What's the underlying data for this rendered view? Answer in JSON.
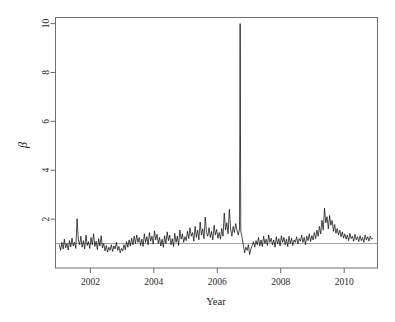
{
  "chart_data": {
    "type": "line",
    "title": "",
    "xlabel": "Year",
    "ylabel": "β",
    "xlim": [
      2000.9,
      2011.05
    ],
    "ylim": [
      0.0,
      10.25
    ],
    "xticks": [
      2002,
      2004,
      2006,
      2008,
      2010
    ],
    "xticklabels": [
      "2002",
      "2004",
      "2006",
      "2008",
      "2010"
    ],
    "yticks": [
      2,
      4,
      6,
      8,
      10
    ],
    "yticklabels": [
      "2",
      "4",
      "6",
      "8",
      "10"
    ],
    "grid": false,
    "legend": false,
    "line_color": "#000000",
    "line_width": 0.7,
    "reference_line": {
      "y": 1.0,
      "color": "#8a8a8a",
      "width": 0.8,
      "orientation": "horizontal"
    },
    "annotations": [
      {
        "text": "extreme spike reaching β ≈ 10 in late 2006",
        "x": 2006.72,
        "y": 10.0
      }
    ],
    "series": [
      {
        "name": "beta",
        "x": [
          2001.02,
          2001.06,
          2001.1,
          2001.14,
          2001.18,
          2001.22,
          2001.26,
          2001.3,
          2001.34,
          2001.38,
          2001.42,
          2001.46,
          2001.5,
          2001.54,
          2001.58,
          2001.62,
          2001.66,
          2001.7,
          2001.74,
          2001.78,
          2001.82,
          2001.86,
          2001.9,
          2001.94,
          2001.98,
          2002.02,
          2002.06,
          2002.1,
          2002.14,
          2002.18,
          2002.22,
          2002.26,
          2002.3,
          2002.34,
          2002.38,
          2002.42,
          2002.46,
          2002.5,
          2002.54,
          2002.58,
          2002.62,
          2002.66,
          2002.7,
          2002.74,
          2002.78,
          2002.82,
          2002.86,
          2002.9,
          2002.94,
          2002.98,
          2003.02,
          2003.06,
          2003.1,
          2003.14,
          2003.18,
          2003.22,
          2003.26,
          2003.3,
          2003.34,
          2003.38,
          2003.42,
          2003.46,
          2003.5,
          2003.54,
          2003.58,
          2003.62,
          2003.66,
          2003.7,
          2003.74,
          2003.78,
          2003.82,
          2003.86,
          2003.9,
          2003.94,
          2003.98,
          2004.02,
          2004.06,
          2004.1,
          2004.14,
          2004.18,
          2004.22,
          2004.26,
          2004.3,
          2004.34,
          2004.38,
          2004.42,
          2004.46,
          2004.5,
          2004.54,
          2004.58,
          2004.62,
          2004.66,
          2004.7,
          2004.74,
          2004.78,
          2004.82,
          2004.86,
          2004.9,
          2004.94,
          2004.98,
          2005.02,
          2005.06,
          2005.1,
          2005.14,
          2005.18,
          2005.22,
          2005.26,
          2005.3,
          2005.34,
          2005.38,
          2005.42,
          2005.46,
          2005.5,
          2005.54,
          2005.58,
          2005.62,
          2005.66,
          2005.7,
          2005.74,
          2005.78,
          2005.82,
          2005.86,
          2005.9,
          2005.94,
          2005.98,
          2006.02,
          2006.06,
          2006.1,
          2006.14,
          2006.18,
          2006.22,
          2006.26,
          2006.3,
          2006.34,
          2006.38,
          2006.42,
          2006.46,
          2006.5,
          2006.54,
          2006.58,
          2006.62,
          2006.66,
          2006.7,
          2006.72,
          2006.74,
          2006.78,
          2006.82,
          2006.86,
          2006.9,
          2006.94,
          2006.98,
          2007.02,
          2007.06,
          2007.1,
          2007.14,
          2007.18,
          2007.22,
          2007.26,
          2007.3,
          2007.34,
          2007.38,
          2007.42,
          2007.46,
          2007.5,
          2007.54,
          2007.58,
          2007.62,
          2007.66,
          2007.7,
          2007.74,
          2007.78,
          2007.82,
          2007.86,
          2007.9,
          2007.94,
          2007.98,
          2008.02,
          2008.06,
          2008.1,
          2008.14,
          2008.18,
          2008.22,
          2008.26,
          2008.3,
          2008.34,
          2008.38,
          2008.42,
          2008.46,
          2008.5,
          2008.54,
          2008.58,
          2008.62,
          2008.66,
          2008.7,
          2008.74,
          2008.78,
          2008.82,
          2008.86,
          2008.9,
          2008.94,
          2008.98,
          2009.02,
          2009.06,
          2009.1,
          2009.14,
          2009.18,
          2009.22,
          2009.26,
          2009.3,
          2009.34,
          2009.38,
          2009.42,
          2009.46,
          2009.5,
          2009.54,
          2009.58,
          2009.62,
          2009.66,
          2009.7,
          2009.74,
          2009.78,
          2009.82,
          2009.86,
          2009.9,
          2009.94,
          2009.98,
          2010.02,
          2010.06,
          2010.1,
          2010.14,
          2010.18,
          2010.22,
          2010.26,
          2010.3,
          2010.34,
          2010.38,
          2010.42,
          2010.46,
          2010.5,
          2010.54,
          2010.58,
          2010.62,
          2010.66,
          2010.7,
          2010.74,
          2010.78,
          2010.82,
          2010.86,
          2010.9
        ],
        "values": [
          0.95,
          0.72,
          1.05,
          0.78,
          1.18,
          0.82,
          1.0,
          0.74,
          1.12,
          0.86,
          1.22,
          0.9,
          1.05,
          0.8,
          2.02,
          1.15,
          0.95,
          1.3,
          0.85,
          1.12,
          0.78,
          1.35,
          0.92,
          1.08,
          0.8,
          1.25,
          0.95,
          1.4,
          0.88,
          1.1,
          0.75,
          1.2,
          0.9,
          1.32,
          0.82,
          1.0,
          0.7,
          0.92,
          0.65,
          0.85,
          0.72,
          0.95,
          0.68,
          0.9,
          0.78,
          1.05,
          0.72,
          0.88,
          0.62,
          0.8,
          0.7,
          0.95,
          0.75,
          1.08,
          0.85,
          1.15,
          0.9,
          1.22,
          0.95,
          1.3,
          1.0,
          1.35,
          1.05,
          1.25,
          0.92,
          1.18,
          0.88,
          1.4,
          1.05,
          1.28,
          0.95,
          1.45,
          1.1,
          1.3,
          0.98,
          1.52,
          1.15,
          1.38,
          1.0,
          1.25,
          0.9,
          1.18,
          0.85,
          1.32,
          1.0,
          1.48,
          1.12,
          1.35,
          0.95,
          1.2,
          0.88,
          1.42,
          1.05,
          1.3,
          0.92,
          1.55,
          1.18,
          1.4,
          1.05,
          1.28,
          1.12,
          1.5,
          1.2,
          1.65,
          1.3,
          1.45,
          1.1,
          1.7,
          1.25,
          1.55,
          1.15,
          1.88,
          1.35,
          1.6,
          1.2,
          2.08,
          1.45,
          1.3,
          1.65,
          1.25,
          1.5,
          1.15,
          1.75,
          1.35,
          1.58,
          1.22,
          1.45,
          1.18,
          1.62,
          1.3,
          2.25,
          1.55,
          1.85,
          1.4,
          2.4,
          1.6,
          1.3,
          1.7,
          1.45,
          1.82,
          1.55,
          1.35,
          1.6,
          10.0,
          1.52,
          1.25,
          0.95,
          0.62,
          0.85,
          0.72,
          0.95,
          0.55,
          0.78,
          0.92,
          1.08,
          0.85,
          1.12,
          0.95,
          1.25,
          0.9,
          1.15,
          0.88,
          1.3,
          1.0,
          1.18,
          0.92,
          1.35,
          1.05,
          1.22,
          0.95,
          1.15,
          0.85,
          1.28,
          0.98,
          1.2,
          0.9,
          1.32,
          1.05,
          1.25,
          0.95,
          1.18,
          0.88,
          1.3,
          1.0,
          1.22,
          0.92,
          1.15,
          1.05,
          1.28,
          0.98,
          1.2,
          1.1,
          1.35,
          1.05,
          1.25,
          0.95,
          1.3,
          1.12,
          1.4,
          1.08,
          1.32,
          1.15,
          1.45,
          1.2,
          1.55,
          1.3,
          1.7,
          1.4,
          1.95,
          1.55,
          2.45,
          1.85,
          2.1,
          1.6,
          2.15,
          1.75,
          1.95,
          1.5,
          1.78,
          1.42,
          1.62,
          1.35,
          1.55,
          1.28,
          1.48,
          1.22,
          1.4,
          1.18,
          1.35,
          1.12,
          1.42,
          1.2,
          1.3,
          1.1,
          1.38,
          1.15,
          1.28,
          1.08,
          1.32,
          1.12,
          1.25,
          1.05,
          1.35,
          1.15,
          1.28,
          1.1,
          1.3,
          1.18,
          1.22
        ]
      }
    ]
  },
  "figure": {
    "background": "#ffffff",
    "axis_color": "#6e6e6e",
    "tick_color": "#6e6e6e"
  }
}
